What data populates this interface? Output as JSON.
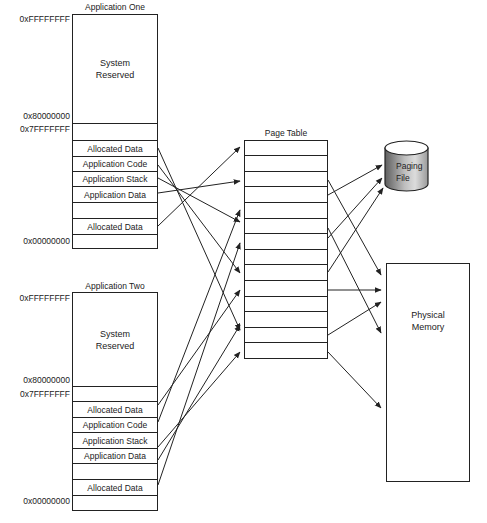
{
  "apps": [
    {
      "title": "Application One",
      "addresses": {
        "top": "0xFFFFFFFF",
        "mid_high": "0x80000000",
        "mid_low": "0x7FFFFFFF",
        "bottom": "0x00000000"
      },
      "system_reserved": [
        "System",
        "Reserved"
      ],
      "segments": [
        "",
        "Allocated Data",
        "Application Code",
        "Application Stack",
        "Application Data",
        "",
        "Allocated Data",
        ""
      ]
    },
    {
      "title": "Application Two",
      "addresses": {
        "top": "0xFFFFFFFF",
        "mid_high": "0x80000000",
        "mid_low": "0x7FFFFFFF",
        "bottom": "0x00000000"
      },
      "system_reserved": [
        "System",
        "Reserved"
      ],
      "segments": [
        "",
        "Allocated Data",
        "Application Code",
        "Application Stack",
        "Application Data",
        "",
        "Allocated Data",
        ""
      ]
    }
  ],
  "page_table": {
    "title": "Page Table",
    "rows": 14
  },
  "paging_file": {
    "label_line1": "Paging",
    "label_line2": "File"
  },
  "physical_memory": {
    "label_line1": "Physical",
    "label_line2": "Memory"
  },
  "colors": {
    "line": "#222222",
    "disk_dark": "#6a6a6a",
    "disk_light": "#d8d8d8"
  }
}
